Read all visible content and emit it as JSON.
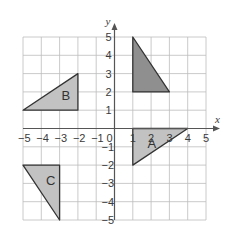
{
  "diagram": {
    "type": "coordinate-grid",
    "x_axis": {
      "label": "x",
      "min": -5,
      "max": 5,
      "ticks": [
        "-5",
        "-4",
        "-3",
        "-2",
        "-1",
        "0",
        "1",
        "2",
        "3",
        "4",
        "5"
      ]
    },
    "y_axis": {
      "label": "y",
      "min": -5,
      "max": 5,
      "ticks": [
        "5",
        "4",
        "3",
        "2",
        "1",
        "-1",
        "-2",
        "-3",
        "-4",
        "-5"
      ]
    },
    "origin_label": "0",
    "colors": {
      "grid": "#bdbdbd",
      "axis": "#555555",
      "outline": "#333333",
      "shaded_dark": "#8f8f8f",
      "shaded_light": "#c2c2c2"
    },
    "shapes": [
      {
        "id": "unlabeled",
        "label": "",
        "points": [
          [
            1,
            5
          ],
          [
            1,
            2
          ],
          [
            3,
            2
          ]
        ],
        "fill": "dark"
      },
      {
        "id": "A",
        "label": "A",
        "points": [
          [
            1,
            0
          ],
          [
            4,
            0
          ],
          [
            1,
            -2
          ]
        ],
        "fill": "light",
        "label_pos": [
          1.8,
          -0.85
        ]
      },
      {
        "id": "B",
        "label": "B",
        "points": [
          [
            -5,
            1
          ],
          [
            -2,
            1
          ],
          [
            -2,
            3
          ]
        ],
        "fill": "light",
        "label_pos": [
          -2.9,
          1.75
        ]
      },
      {
        "id": "C",
        "label": "C",
        "points": [
          [
            -5,
            -2
          ],
          [
            -3,
            -2
          ],
          [
            -3,
            -5
          ]
        ],
        "fill": "light",
        "label_pos": [
          -3.75,
          -2.85
        ]
      }
    ]
  }
}
